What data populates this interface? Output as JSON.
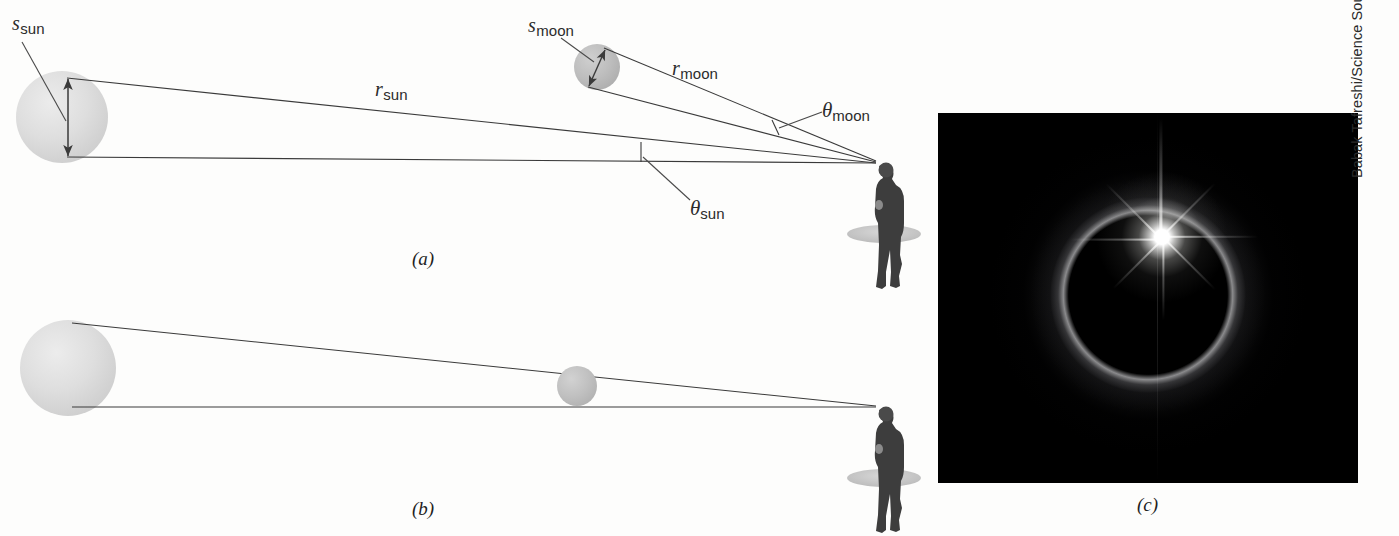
{
  "figure": {
    "background_color": "#fdfdfc",
    "line_color": "#3a3a3a"
  },
  "panels": [
    {
      "id": "a",
      "label": "(a)",
      "description": "Sun and Moon subtend the same angle at the observer"
    },
    {
      "id": "b",
      "label": "(b)",
      "description": "Moon exactly covers the Sun along the line of sight"
    },
    {
      "id": "c",
      "label": "(c)",
      "description": "Photograph of a total solar eclipse showing the diamond ring effect"
    }
  ],
  "labels": {
    "s_sun": {
      "symbol": "s",
      "subscript": "sun",
      "meaning": "diameter of the Sun"
    },
    "s_moon": {
      "symbol": "s",
      "subscript": "moon",
      "meaning": "diameter of the Moon"
    },
    "r_sun": {
      "symbol": "r",
      "subscript": "sun",
      "meaning": "distance to the Sun"
    },
    "r_moon": {
      "symbol": "r",
      "subscript": "moon",
      "meaning": "distance to the Moon"
    },
    "theta_sun": {
      "symbol": "θ",
      "subscript": "sun",
      "meaning": "angular size of the Sun"
    },
    "theta_moon": {
      "symbol": "θ",
      "subscript": "moon",
      "meaning": "angular size of the Moon"
    }
  },
  "objects": {
    "sun": {
      "name": "Sun",
      "color": "#dcdcdc"
    },
    "moon": {
      "name": "Moon",
      "color": "#b9b9b9"
    },
    "observer": {
      "name": "observer",
      "color": "#3d3d3d"
    }
  },
  "photo": {
    "subject": "total solar eclipse diamond ring",
    "credit": "Babak Tafreshi/Science Source",
    "background_color": "#000000"
  }
}
